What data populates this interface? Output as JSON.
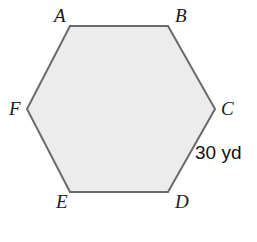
{
  "figure": {
    "type": "regular-hexagon",
    "shape_name": "hexagon-ABCDEF",
    "fill_color": "#ececec",
    "stroke_color": "#6b6b6b",
    "stroke_width": 2,
    "background_color": "#ffffff",
    "points": "70,26 168,26 215,109 168,192 70,192 27,109",
    "vertices": [
      {
        "name": "A",
        "label": "A",
        "x": 70,
        "y": 26
      },
      {
        "name": "B",
        "label": "B",
        "x": 168,
        "y": 26
      },
      {
        "name": "C",
        "label": "C",
        "x": 215,
        "y": 109
      },
      {
        "name": "D",
        "label": "D",
        "x": 168,
        "y": 192
      },
      {
        "name": "E",
        "label": "E",
        "x": 70,
        "y": 192
      },
      {
        "name": "F",
        "label": "F",
        "x": 27,
        "y": 109
      }
    ],
    "side_labels": [
      {
        "name": "side-CD",
        "text": "30 yd",
        "value": 30,
        "unit": "yd"
      }
    ]
  }
}
